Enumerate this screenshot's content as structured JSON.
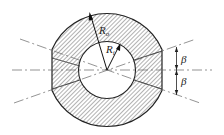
{
  "diagram": {
    "type": "cross-section",
    "colors": {
      "stroke": "#222222",
      "hatch": "#555555",
      "centerline": "#666666",
      "background": "#ffffff"
    },
    "labels": {
      "outer_radius": {
        "base": "R",
        "sub": "o"
      },
      "inner_radius": {
        "base": "R",
        "sub": "i"
      },
      "angle_upper": "β",
      "angle_lower": "β"
    }
  }
}
